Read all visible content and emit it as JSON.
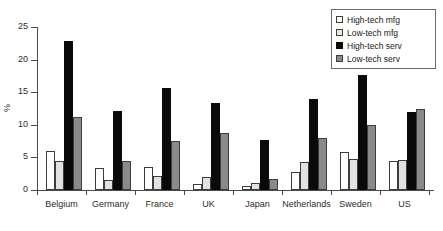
{
  "chart_data": {
    "type": "bar",
    "title": "",
    "xlabel": "",
    "ylabel": "%",
    "ylim": [
      0,
      25
    ],
    "yticks": [
      0,
      5,
      10,
      15,
      20,
      25
    ],
    "grid": false,
    "legend_position": "top-right",
    "categories": [
      "Belgium",
      "Germany",
      "France",
      "UK",
      "Japan",
      "Netherlands",
      "Sweden",
      "US"
    ],
    "series": [
      {
        "name": "High-tech mfg",
        "values": [
          6.0,
          3.4,
          3.5,
          0.9,
          0.6,
          2.8,
          5.9,
          4.5
        ]
      },
      {
        "name": "Low-tech mfg",
        "values": [
          4.5,
          1.6,
          2.1,
          2.0,
          1.1,
          4.3,
          4.7,
          4.6
        ]
      },
      {
        "name": "High-tech serv",
        "values": [
          22.8,
          12.1,
          15.6,
          13.3,
          7.6,
          13.9,
          17.7,
          12.0
        ]
      },
      {
        "name": "Low-tech serv",
        "values": [
          11.2,
          4.5,
          7.5,
          8.7,
          1.7,
          8.0,
          9.9,
          12.4
        ]
      }
    ],
    "colors": {
      "high_tech_mfg": "#ffffff",
      "low_tech_mfg": "#e2e2e2",
      "high_tech_serv": "#0a0a0a",
      "low_tech_serv": "#8a8a8a",
      "axis": "#4a4a4a",
      "text": "#2b2b2b",
      "background": "#ffffff"
    }
  },
  "legend": {
    "items": [
      {
        "label": "High-tech mfg"
      },
      {
        "label": "Low-tech mfg"
      },
      {
        "label": "High-tech serv"
      },
      {
        "label": "Low-tech serv"
      }
    ]
  }
}
